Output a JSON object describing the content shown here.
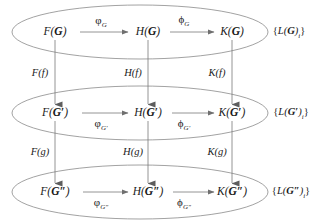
{
  "diagram": {
    "colors": {
      "stroke": "#7a7a7a",
      "ink": "#1a1a1a",
      "background": "#ffffff"
    },
    "rows": [
      {
        "id": "row-G",
        "object": "G",
        "nodes": [
          {
            "id": "node-F-G",
            "functor": "F",
            "open": "(",
            "obj": "G",
            "prime": "",
            "close": ")",
            "x": 55,
            "y": 32
          },
          {
            "id": "node-H-G",
            "functor": "H",
            "open": "(",
            "obj": "G",
            "prime": "",
            "close": ")",
            "x": 148,
            "y": 32
          },
          {
            "id": "node-K-G",
            "functor": "K",
            "open": "(",
            "obj": "G",
            "prime": "",
            "close": ")",
            "x": 232,
            "y": 32
          }
        ],
        "edges": [
          {
            "id": "edge-phi-G",
            "glyph": "φ",
            "sub": "G",
            "sub_prime": "",
            "x": 101,
            "y": 22,
            "from_x": 80,
            "to_x": 128,
            "y_line": 32
          },
          {
            "id": "edge-Phi-G",
            "glyph": "ϕ",
            "sub": "G",
            "sub_prime": "",
            "x": 184,
            "y": 21,
            "from_x": 170,
            "to_x": 214,
            "y_line": 32
          }
        ],
        "set_label": {
          "id": "set-label-G",
          "open": "{",
          "functor": "L",
          "obj": "G",
          "prime": "",
          "index": "i",
          "close": "}",
          "x": 289,
          "y": 33
        },
        "ellipse": {
          "cx": 140,
          "cy": 32,
          "rx": 128,
          "ry": 27
        }
      },
      {
        "id": "row-Gprime",
        "object": "G'",
        "nodes": [
          {
            "id": "node-F-Gprime",
            "functor": "F",
            "open": "(",
            "obj": "G",
            "prime": "′",
            "close": ")",
            "x": 55,
            "y": 113
          },
          {
            "id": "node-H-Gprime",
            "functor": "H",
            "open": "(",
            "obj": "G",
            "prime": "′",
            "close": ")",
            "x": 148,
            "y": 113
          },
          {
            "id": "node-K-Gprime",
            "functor": "K",
            "open": "(",
            "obj": "G",
            "prime": "′",
            "close": ")",
            "x": 232,
            "y": 113
          }
        ],
        "edges": [
          {
            "id": "edge-phi-Gprime",
            "glyph": "φ",
            "sub": "G",
            "sub_prime": "′",
            "x": 101,
            "y": 125,
            "from_x": 82,
            "to_x": 128,
            "y_line": 113
          },
          {
            "id": "edge-Phi-Gprime",
            "glyph": "ϕ",
            "sub": "G",
            "sub_prime": "′",
            "x": 184,
            "y": 125,
            "from_x": 172,
            "to_x": 214,
            "y_line": 113
          }
        ],
        "set_label": {
          "id": "set-label-Gprime",
          "open": "{",
          "functor": "L",
          "obj": "G",
          "prime": "′",
          "index": "i",
          "close": "}",
          "x": 291,
          "y": 114
        },
        "ellipse": {
          "cx": 140,
          "cy": 113,
          "rx": 128,
          "ry": 27
        }
      },
      {
        "id": "row-Gdoubleprime",
        "object": "G''",
        "nodes": [
          {
            "id": "node-F-Gdoubleprime",
            "functor": "F",
            "open": "(",
            "obj": "G",
            "prime": "″",
            "close": ")",
            "x": 55,
            "y": 192
          },
          {
            "id": "node-H-Gdoubleprime",
            "functor": "H",
            "open": "(",
            "obj": "G",
            "prime": "″",
            "close": ")",
            "x": 148,
            "y": 192
          },
          {
            "id": "node-K-Gdoubleprime",
            "functor": "K",
            "open": "(",
            "obj": "G",
            "prime": "″",
            "close": ")",
            "x": 232,
            "y": 192
          }
        ],
        "edges": [
          {
            "id": "edge-phi-Gdoubleprime",
            "glyph": "φ",
            "sub": "G",
            "sub_prime": "″",
            "x": 101,
            "y": 204,
            "from_x": 83,
            "to_x": 128,
            "y_line": 192
          },
          {
            "id": "edge-Phi-Gdoubleprime",
            "glyph": "ϕ",
            "sub": "G",
            "sub_prime": "″",
            "x": 184,
            "y": 204,
            "from_x": 173,
            "to_x": 214,
            "y_line": 192
          }
        ],
        "set_label": {
          "id": "set-label-Gdoubleprime",
          "open": "{",
          "functor": "L",
          "obj": "G",
          "prime": "″",
          "index": "i",
          "close": "}",
          "x": 291,
          "y": 193
        },
        "ellipse": {
          "cx": 140,
          "cy": 192,
          "rx": 128,
          "ry": 27
        }
      }
    ],
    "vertical_edges": [
      {
        "id": "vedge-F-f",
        "functor": "F",
        "open": "(",
        "arg": "f",
        "close": ")",
        "x": 40,
        "y": 73,
        "line_x": 55,
        "from_y": 40,
        "to_y": 104
      },
      {
        "id": "vedge-H-f",
        "functor": "H",
        "open": "(",
        "arg": "f",
        "close": ")",
        "x": 133,
        "y": 73,
        "line_x": 148,
        "from_y": 40,
        "to_y": 104
      },
      {
        "id": "vedge-K-f",
        "functor": "K",
        "open": "(",
        "arg": "f",
        "close": ")",
        "x": 217,
        "y": 73,
        "line_x": 232,
        "from_y": 40,
        "to_y": 104
      },
      {
        "id": "vedge-F-g",
        "functor": "F",
        "open": "(",
        "arg": "g",
        "close": ")",
        "x": 40,
        "y": 152,
        "line_x": 55,
        "from_y": 121,
        "to_y": 183
      },
      {
        "id": "vedge-H-g",
        "functor": "H",
        "open": "(",
        "arg": "g",
        "close": ")",
        "x": 133,
        "y": 152,
        "line_x": 148,
        "from_y": 121,
        "to_y": 183
      },
      {
        "id": "vedge-K-g",
        "functor": "K",
        "open": "(",
        "arg": "g",
        "close": ")",
        "x": 217,
        "y": 152,
        "line_x": 232,
        "from_y": 121,
        "to_y": 183
      }
    ]
  }
}
